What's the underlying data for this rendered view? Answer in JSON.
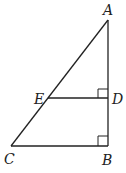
{
  "diagram": {
    "type": "geometry-triangle",
    "stroke_color": "#222222",
    "background": "#ffffff",
    "points": {
      "A": {
        "label": "A",
        "x": 108,
        "y": 20
      },
      "B": {
        "label": "B",
        "x": 108,
        "y": 146
      },
      "C": {
        "label": "C",
        "x": 11,
        "y": 146
      },
      "D": {
        "label": "D",
        "x": 108,
        "y": 98
      },
      "E": {
        "label": "E",
        "x": 48,
        "y": 98
      }
    },
    "segments": [
      "AB",
      "BC",
      "CA",
      "ED"
    ],
    "right_angles": [
      "ADE",
      "ABC"
    ]
  }
}
